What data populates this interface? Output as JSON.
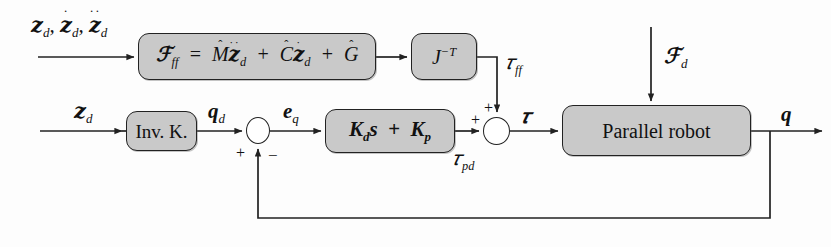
{
  "diagram": {
    "type": "control-block-diagram",
    "colors": {
      "block_fill": "#c9c9c9",
      "block_stroke": "#222222",
      "wire": "#222222",
      "background": "#ffffff"
    }
  },
  "blocks": [
    {
      "id": "feedforward",
      "label": "F_ff = M_hat X_d_ddot + C_hat X_d_dot + G_hat",
      "name": "feedforward-dynamics-block"
    },
    {
      "id": "jacobian_transpose",
      "label": "J^-T",
      "name": "jacobian-inverse-transpose-block"
    },
    {
      "id": "inverse_kinematics",
      "label": "Inv. K.",
      "name": "inverse-kinematics-block"
    },
    {
      "id": "pd_controller",
      "label": "K_d s + K_p",
      "name": "pd-controller-block"
    },
    {
      "id": "plant",
      "label": "Parallel robot",
      "name": "parallel-robot-block"
    }
  ],
  "block_labels": {
    "inverse_kinematics": "Inv. K.",
    "plant": "Parallel robot"
  },
  "signals": {
    "desired_pose_triplet": "X_d, X_d_dot, X_d_ddot",
    "desired_pose": "X_d",
    "desired_joint": "q_d",
    "joint_error": "e_q",
    "tau_feedforward": "tau_ff",
    "tau_pd": "tau_pd",
    "tau_total": "tau",
    "disturbance": "F_d",
    "joint_output": "q"
  },
  "sum_junctions": [
    {
      "id": "error_sum",
      "name": "error-summing-junction",
      "inputs": [
        {
          "label": "+",
          "from": "q_d"
        },
        {
          "label": "−",
          "from": "q"
        }
      ],
      "output": "e_q"
    },
    {
      "id": "torque_sum",
      "name": "torque-summing-junction",
      "inputs": [
        {
          "label": "+",
          "from": "tau_pd"
        },
        {
          "label": "+",
          "from": "tau_ff"
        }
      ],
      "output": "tau"
    }
  ],
  "signs": {
    "plus": "+",
    "minus": "−"
  },
  "equations": {
    "feedforward_lhs": "F",
    "feedforward_lhs_sub": "ff",
    "equals": "=",
    "plus": "+",
    "M_hat": "M",
    "C_hat": "C",
    "G_hat": "G",
    "J": "J",
    "J_exponent": "−T",
    "Kd": "K",
    "Kd_sub": "d",
    "s": "s",
    "Kp": "K",
    "Kp_sub": "p",
    "X": "𝒛",
    "F": "ℱ",
    "q": "q",
    "e": "e",
    "tau": "τ",
    "sub_d": "d",
    "sub_q": "q",
    "sub_ff": "ff",
    "sub_pd": "pd",
    "dot_one": "˙",
    "dot_two": "˙˙",
    "hat": "ˆ"
  }
}
